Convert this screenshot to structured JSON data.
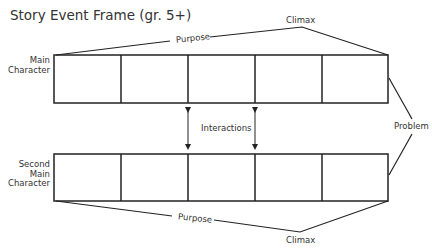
{
  "title": "Story Event Frame (gr. 5+)",
  "labels": {
    "main_character": [
      "Main",
      "Character"
    ],
    "second_main_character": [
      "Second",
      "Main",
      "Character"
    ],
    "purpose_top": "Purpose",
    "purpose_bottom": "Purpose",
    "climax_top": "Climax",
    "climax_bottom": "Climax",
    "interactions": "Interactions",
    "problem": "Problem"
  },
  "rows": [
    {
      "name": "main-character-row",
      "boxes": 5
    },
    {
      "name": "second-main-character-row",
      "boxes": 5
    }
  ]
}
